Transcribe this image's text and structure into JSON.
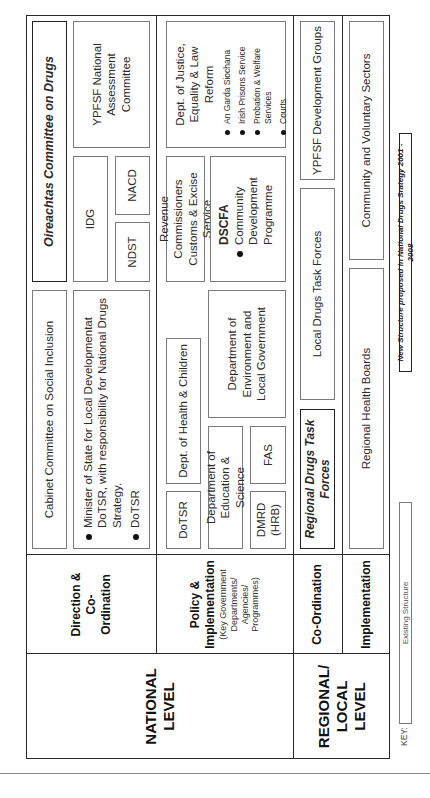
{
  "levels": {
    "national": "NATIONAL LEVEL",
    "regional": "REGIONAL/ LOCAL LEVEL"
  },
  "row_labels": {
    "direction": "Direction & Co-Ordination",
    "policy": "Policy & Implementation",
    "policy_sub": "(Key Government Departments/ Agencies/ Programmes)",
    "coordination": "Co-Ordination",
    "implementation": "Implementation"
  },
  "direction": {
    "cabinet": "Cabinet Committee on Social Inclusion",
    "oireachtas": "Oireachtas Committee on Drugs",
    "minister_bullets": [
      "Minister of State for Local Developmentat DoTSR, with responsibility for National Drugs Strategy.",
      "DoTSR"
    ],
    "idg": "IDG",
    "ndst": "NDST",
    "nacd": "NACD",
    "ypfsf_nac": "YPFSF National Assessment Committee"
  },
  "policy": {
    "dotsr": "DoTSR",
    "health": "Dept. of Health & Children",
    "education": "Department of Education & Science",
    "dmrd": "DMRD (HRB)",
    "fas": "FAS",
    "environment": "Department of Environment and Local Government",
    "revenue": "Revenue Commissioners Customs & Excise Service",
    "dscfa_title": "DSCFA",
    "dscfa_bullets": [
      "Community Development Programme"
    ],
    "justice_title": "Dept. of Justice, Equality & Law Reform",
    "justice_bullets": [
      "An Garda Siochana",
      "Irish Prisons Service",
      "Probation & Welfare Services",
      "Courts"
    ]
  },
  "regional": {
    "rdtf": "Regional Drugs Task Forces",
    "ldtf": "Local Drugs Task Forces",
    "ypfsf_dev": "YPFSF Development Groups",
    "health_boards": "Regional Health Boards",
    "community": "Community and Voluntary Sectors"
  },
  "key": {
    "label": "KEY:",
    "existing": "Existing Structure",
    "new": "New Structure proposed in National Drugs Srategy 2001 - 2008"
  }
}
